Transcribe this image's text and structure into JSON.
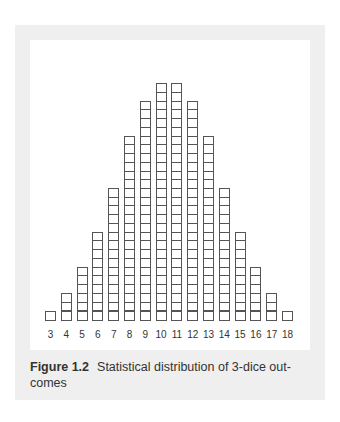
{
  "chart_data": {
    "type": "bar",
    "figure_label": "Figure 1.2",
    "xlabel": "",
    "ylabel": "",
    "categories": [
      "3",
      "4",
      "5",
      "6",
      "7",
      "8",
      "9",
      "10",
      "11",
      "12",
      "13",
      "14",
      "15",
      "16",
      "17",
      "18"
    ],
    "values": [
      1,
      3,
      6,
      10,
      15,
      21,
      25,
      27,
      27,
      25,
      21,
      15,
      10,
      6,
      3,
      1
    ],
    "ylim": [
      0,
      27
    ],
    "grid": false,
    "legend": null,
    "style": "stacked unit boxes"
  },
  "caption": {
    "label": "Figure 1.2",
    "text": "Statistical distribution of 3-dice out-comes"
  },
  "colors": {
    "frame": "#efefef",
    "box_border": "#555555",
    "text": "#333333"
  }
}
